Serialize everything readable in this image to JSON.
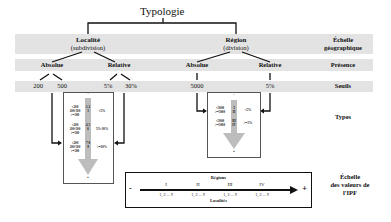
{
  "title": "Typologie",
  "rows": {
    "geographic_scale": {
      "label_line1": "Échelle",
      "label_line2": "géographique"
    },
    "presence": {
      "label": "Présence"
    },
    "thresholds": {
      "label": "Seuils"
    },
    "types": {
      "label": "Types"
    },
    "ipf_scale": {
      "label_line1": "Échelle",
      "label_line2": "des valeurs de",
      "label_line3": "l'IPF"
    }
  },
  "branches": {
    "locality": {
      "name": "Localité",
      "sub": "(subdivision)",
      "absolute": {
        "label": "Absolue",
        "thresholds": [
          "200",
          "500"
        ]
      },
      "relative": {
        "label": "Relative",
        "thresholds": [
          "5%",
          "30%"
        ]
      },
      "types_box": {
        "top_sign": "-",
        "bottom_sign": "+",
        "groups": [
          {
            "absolute": [
              "<200",
              "200-500",
              ">=500"
            ],
            "numbers": "1 2 3",
            "relative": "<5%"
          },
          {
            "absolute": [
              "<200",
              "200-500",
              ">=500"
            ],
            "numbers": "4 5 6",
            "relative": "5%-30%"
          },
          {
            "absolute": [
              "<200",
              "200-500",
              ">=500"
            ],
            "numbers": "7 8 9",
            "relative": ">=30%"
          }
        ]
      }
    },
    "region": {
      "name": "Région",
      "sub": "(division)",
      "absolute": {
        "label": "Absolue",
        "thresholds": [
          "5000"
        ]
      },
      "relative": {
        "label": "Relative",
        "thresholds": [
          "5%"
        ]
      },
      "types_box": {
        "top_sign": "-",
        "bottom_sign": "+",
        "groups": [
          {
            "absolute": [
              "<5000",
              ">=5000"
            ],
            "numerals": [
              "I",
              "II"
            ],
            "relative": "<5%"
          },
          {
            "absolute": [
              "<5000",
              ">=5000"
            ],
            "numerals": [
              "III",
              "IV"
            ],
            "relative": ">=5%"
          }
        ]
      }
    }
  },
  "scale": {
    "top_label": "Régions",
    "bottom_label": "Localités",
    "minus": "-",
    "plus": "+",
    "regions": [
      {
        "numeral": "I",
        "localities": "1, 2 ... 9"
      },
      {
        "numeral": "II",
        "localities": "1, 2 ... 9"
      },
      {
        "numeral": "III",
        "localities": "1, 2 ... 9"
      },
      {
        "numeral": "IV",
        "localities": "1, 2 ... 9"
      }
    ]
  },
  "colors": {
    "band": "#e3e3e3",
    "arrow": "#bdbdbd",
    "line": "#111111"
  }
}
